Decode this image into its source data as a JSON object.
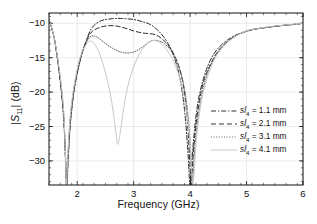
{
  "chart_data": {
    "type": "line",
    "title": "",
    "xlabel": "Frequency (GHz)",
    "ylabel": "|S11| (dB)",
    "xlim": [
      1.5,
      6.0
    ],
    "ylim": [
      -33.5,
      -8.5
    ],
    "xticks": [
      "2",
      "3",
      "4",
      "5",
      "6"
    ],
    "xtick_values": [
      2,
      3,
      4,
      5,
      6
    ],
    "yticks": [
      "−10",
      "−15",
      "−20",
      "−25",
      "−30"
    ],
    "ytick_values": [
      -10,
      -15,
      -20,
      -25,
      -30
    ],
    "x_minor_step": 0.2,
    "y_minor_step": 1,
    "grid": "major gridlines, light gray",
    "legend_position": "right-middle",
    "series": [
      {
        "name": "sl4 = 1.1 mm",
        "param": "sl",
        "subscript": "4",
        "value": "1.1 mm",
        "style": "dash-dot",
        "color": "#1a1a1a",
        "points": [
          [
            1.5,
            -9.4
          ],
          [
            1.6,
            -12.5
          ],
          [
            1.7,
            -18.5
          ],
          [
            1.76,
            -24.0
          ],
          [
            1.8,
            -30.5
          ],
          [
            1.82,
            -33.4
          ],
          [
            1.84,
            -30.0
          ],
          [
            1.88,
            -24.5
          ],
          [
            1.95,
            -19.5
          ],
          [
            2.05,
            -15.5
          ],
          [
            2.15,
            -12.8
          ],
          [
            2.25,
            -10.8
          ],
          [
            2.4,
            -9.7
          ],
          [
            2.6,
            -9.35
          ],
          [
            2.8,
            -9.3
          ],
          [
            3.0,
            -9.45
          ],
          [
            3.15,
            -9.75
          ],
          [
            3.3,
            -10.2
          ],
          [
            3.45,
            -11.2
          ],
          [
            3.6,
            -12.8
          ],
          [
            3.72,
            -15.0
          ],
          [
            3.82,
            -18.0
          ],
          [
            3.9,
            -22.5
          ],
          [
            3.96,
            -28.5
          ],
          [
            4.0,
            -33.4
          ],
          [
            4.05,
            -28.0
          ],
          [
            4.12,
            -22.5
          ],
          [
            4.22,
            -18.5
          ],
          [
            4.35,
            -15.5
          ],
          [
            4.5,
            -13.6
          ],
          [
            4.7,
            -12.2
          ],
          [
            4.9,
            -11.4
          ],
          [
            5.1,
            -10.9
          ],
          [
            5.35,
            -10.6
          ],
          [
            5.6,
            -10.35
          ],
          [
            5.8,
            -10.2
          ],
          [
            6.0,
            -10.0
          ]
        ]
      },
      {
        "name": "sl4 = 2.1 mm",
        "param": "sl",
        "subscript": "4",
        "value": "2.1 mm",
        "style": "dashed",
        "color": "#1a1a1a",
        "points": [
          [
            1.5,
            -9.4
          ],
          [
            1.6,
            -12.5
          ],
          [
            1.7,
            -18.3
          ],
          [
            1.76,
            -23.5
          ],
          [
            1.79,
            -29.5
          ],
          [
            1.81,
            -33.4
          ],
          [
            1.84,
            -29.0
          ],
          [
            1.88,
            -24.0
          ],
          [
            1.95,
            -19.3
          ],
          [
            2.05,
            -15.3
          ],
          [
            2.15,
            -12.8
          ],
          [
            2.25,
            -11.3
          ],
          [
            2.4,
            -10.6
          ],
          [
            2.55,
            -10.35
          ],
          [
            2.7,
            -10.4
          ],
          [
            2.85,
            -10.7
          ],
          [
            3.0,
            -11.1
          ],
          [
            3.15,
            -11.4
          ],
          [
            3.28,
            -11.5
          ],
          [
            3.4,
            -11.7
          ],
          [
            3.52,
            -12.4
          ],
          [
            3.65,
            -13.6
          ],
          [
            3.78,
            -15.8
          ],
          [
            3.88,
            -19.0
          ],
          [
            3.95,
            -24.0
          ],
          [
            4.0,
            -31.0
          ],
          [
            4.02,
            -33.4
          ],
          [
            4.07,
            -27.5
          ],
          [
            4.15,
            -22.0
          ],
          [
            4.25,
            -18.2
          ],
          [
            4.4,
            -15.3
          ],
          [
            4.55,
            -13.5
          ],
          [
            4.75,
            -12.1
          ],
          [
            4.95,
            -11.3
          ],
          [
            5.15,
            -10.85
          ],
          [
            5.4,
            -10.55
          ],
          [
            5.65,
            -10.3
          ],
          [
            5.85,
            -10.15
          ],
          [
            6.0,
            -10.0
          ]
        ]
      },
      {
        "name": "sl4 = 3.1 mm",
        "param": "sl",
        "subscript": "4",
        "value": "3.1 mm",
        "style": "dotted",
        "color": "#555555",
        "points": [
          [
            1.5,
            -9.4
          ],
          [
            1.6,
            -12.4
          ],
          [
            1.7,
            -18.0
          ],
          [
            1.76,
            -23.0
          ],
          [
            1.79,
            -29.0
          ],
          [
            1.81,
            -33.4
          ],
          [
            1.84,
            -28.5
          ],
          [
            1.88,
            -23.5
          ],
          [
            1.95,
            -19.0
          ],
          [
            2.05,
            -15.2
          ],
          [
            2.15,
            -13.0
          ],
          [
            2.24,
            -11.9
          ],
          [
            2.35,
            -12.0
          ],
          [
            2.48,
            -12.8
          ],
          [
            2.62,
            -13.6
          ],
          [
            2.78,
            -14.2
          ],
          [
            2.92,
            -14.3
          ],
          [
            3.05,
            -14.0
          ],
          [
            3.18,
            -13.3
          ],
          [
            3.3,
            -12.6
          ],
          [
            3.42,
            -12.5
          ],
          [
            3.55,
            -13.0
          ],
          [
            3.68,
            -14.2
          ],
          [
            3.8,
            -16.3
          ],
          [
            3.9,
            -19.5
          ],
          [
            3.97,
            -24.0
          ],
          [
            4.02,
            -30.0
          ],
          [
            4.04,
            -33.4
          ],
          [
            4.09,
            -27.5
          ],
          [
            4.17,
            -22.0
          ],
          [
            4.28,
            -18.0
          ],
          [
            4.42,
            -15.2
          ],
          [
            4.58,
            -13.4
          ],
          [
            4.78,
            -12.0
          ],
          [
            4.98,
            -11.2
          ],
          [
            5.18,
            -10.8
          ],
          [
            5.42,
            -10.5
          ],
          [
            5.67,
            -10.28
          ],
          [
            5.86,
            -10.12
          ],
          [
            6.0,
            -10.0
          ]
        ]
      },
      {
        "name": "sl4 = 4.1 mm",
        "param": "sl",
        "subscript": "4",
        "value": "4.1 mm",
        "style": "solid",
        "color": "#c9c9c9",
        "points": [
          [
            1.5,
            -9.4
          ],
          [
            1.6,
            -12.4
          ],
          [
            1.7,
            -17.8
          ],
          [
            1.76,
            -22.8
          ],
          [
            1.79,
            -28.8
          ],
          [
            1.81,
            -33.4
          ],
          [
            1.84,
            -28.2
          ],
          [
            1.88,
            -23.2
          ],
          [
            1.95,
            -18.8
          ],
          [
            2.05,
            -15.0
          ],
          [
            2.15,
            -13.2
          ],
          [
            2.22,
            -12.6
          ],
          [
            2.3,
            -12.9
          ],
          [
            2.4,
            -14.5
          ],
          [
            2.5,
            -17.2
          ],
          [
            2.58,
            -20.0
          ],
          [
            2.64,
            -23.0
          ],
          [
            2.69,
            -26.2
          ],
          [
            2.72,
            -27.6
          ],
          [
            2.76,
            -26.0
          ],
          [
            2.82,
            -22.5
          ],
          [
            2.9,
            -19.0
          ],
          [
            3.0,
            -16.3
          ],
          [
            3.12,
            -14.2
          ],
          [
            3.25,
            -12.9
          ],
          [
            3.36,
            -12.5
          ],
          [
            3.48,
            -12.9
          ],
          [
            3.6,
            -14.0
          ],
          [
            3.72,
            -15.8
          ],
          [
            3.84,
            -18.6
          ],
          [
            3.93,
            -22.5
          ],
          [
            4.0,
            -27.5
          ],
          [
            4.05,
            -33.4
          ],
          [
            4.11,
            -27.0
          ],
          [
            4.19,
            -21.8
          ],
          [
            4.3,
            -18.0
          ],
          [
            4.44,
            -15.1
          ],
          [
            4.6,
            -13.3
          ],
          [
            4.8,
            -11.9
          ],
          [
            5.0,
            -11.1
          ],
          [
            5.2,
            -10.75
          ],
          [
            5.44,
            -10.45
          ],
          [
            5.68,
            -10.25
          ],
          [
            5.87,
            -10.1
          ],
          [
            6.0,
            -10.0
          ]
        ]
      }
    ]
  },
  "axes": {
    "plot_left_px": 49,
    "plot_top_px": 13,
    "plot_right_px": 303,
    "plot_bottom_px": 185
  }
}
